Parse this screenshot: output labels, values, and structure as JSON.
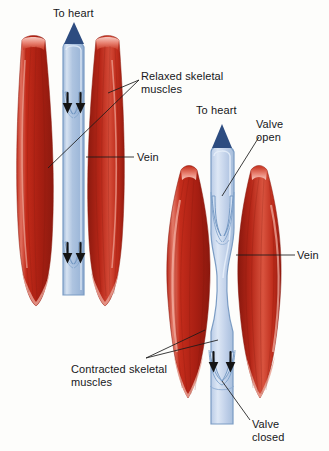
{
  "figure": {
    "background_color": "#fdfdfb",
    "width": 329,
    "height": 451
  },
  "colors": {
    "muscle_red_dark": "#a81f14",
    "muscle_red": "#c62a1b",
    "muscle_red_light": "#e4685a",
    "muscle_highlight": "#f3b3a8",
    "vein_blue": "#aec4e0",
    "vein_blue_light": "#cfdcef",
    "vein_outline": "#7b9cc4",
    "arrow_navy": "#2d4c80",
    "valve_arrow_black": "#141414",
    "label_text": "#17171a",
    "leader_line": "#1a1a1a"
  },
  "labels": {
    "to_heart_left": "To heart",
    "to_heart_right": "To heart",
    "relaxed_muscles": "Relaxed skeletal\nmuscles",
    "vein_left": "Vein",
    "vein_right": "Vein",
    "valve_open": "Valve\nopen",
    "contracted_muscles": "Contracted skeletal\nmuscles",
    "valve_closed": "Valve\nclosed"
  },
  "panels": [
    {
      "id": "left-panel",
      "name": "relaxed-muscle-panel",
      "muscle_state": "relaxed",
      "blood_flow_direction": "upward to heart",
      "valve_count": 2,
      "valve_state": "open-ish with backflow arrows",
      "vein_shape": "straight narrow column"
    },
    {
      "id": "right-panel",
      "name": "contracted-muscle-panel",
      "muscle_state": "contracted",
      "blood_flow_direction": "upward to heart",
      "valve_count": 2,
      "valve_state": "upper valve open, lower valve closed",
      "vein_shape": "compressed by bulging muscles"
    }
  ]
}
